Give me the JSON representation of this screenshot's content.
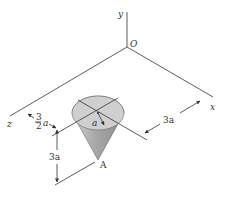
{
  "diagram": {
    "type": "3d-statics-figure",
    "axes": {
      "x_label": "x",
      "y_label": "y",
      "z_label": "z",
      "origin_label": "O"
    },
    "body": {
      "shape": "cone",
      "apex_label": "A",
      "radius_label": "a",
      "fill_color": "#b8b8b8"
    },
    "dimensions": {
      "z_offset_numerator": "3",
      "z_offset_denominator": "2",
      "z_offset_symbol": "a",
      "height_label": "3a",
      "x_offset_label": "3a"
    }
  }
}
